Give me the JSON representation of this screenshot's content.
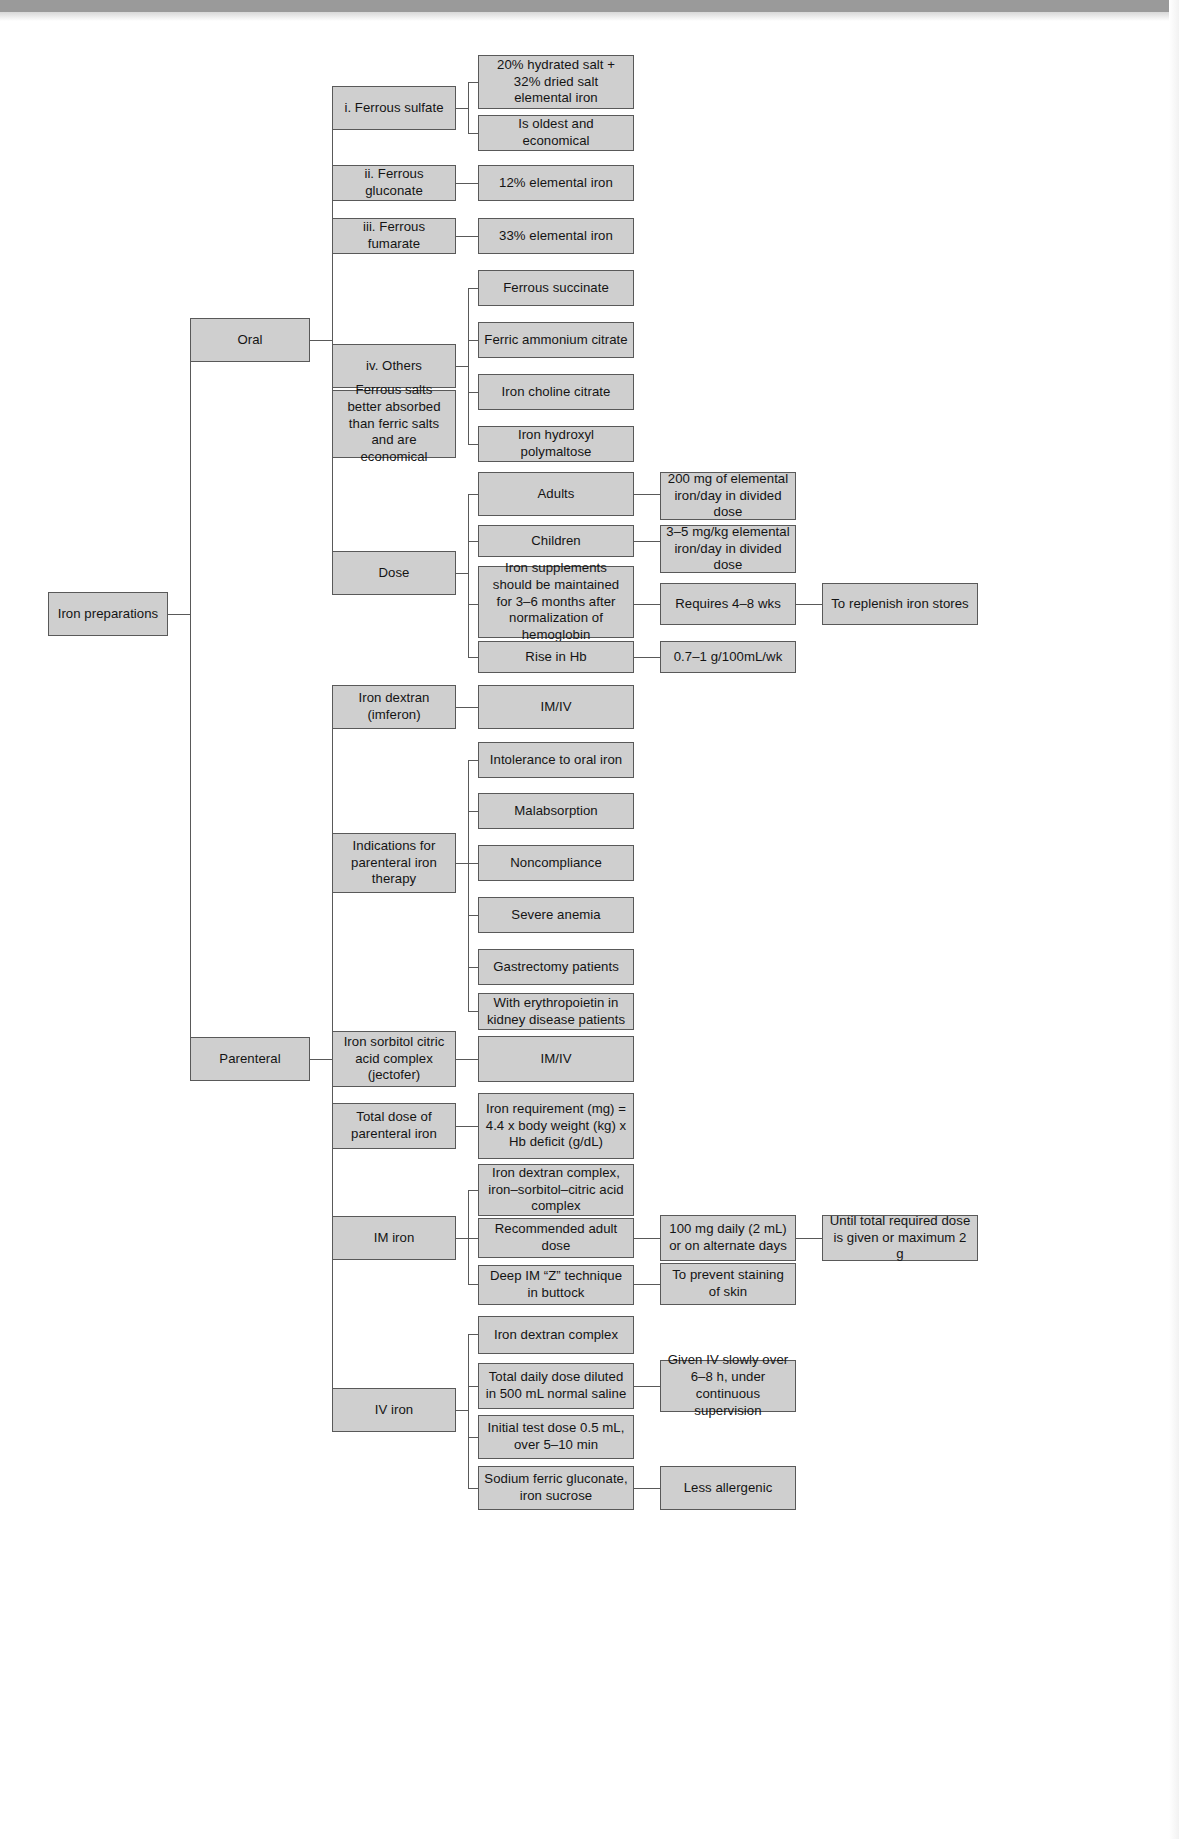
{
  "diagram": {
    "title": "Iron preparations",
    "root": {
      "label": "Iron preparations"
    },
    "branches": {
      "oral": {
        "label": "Oral"
      },
      "parenteral": {
        "label": "Parenteral"
      }
    },
    "oral_children": {
      "ferrous_sulfate": {
        "label": "i. Ferrous sulfate"
      },
      "ferrous_sulfate_d1": {
        "label": "20% hydrated salt + 32% dried salt elemental iron"
      },
      "ferrous_sulfate_d2": {
        "label": "Is oldest and economical"
      },
      "ferrous_gluconate": {
        "label": "ii. Ferrous gluconate"
      },
      "ferrous_gluconate_d1": {
        "label": "12% elemental iron"
      },
      "ferrous_fumarate": {
        "label": "iii. Ferrous fumarate"
      },
      "ferrous_fumarate_d1": {
        "label": "33% elemental iron"
      },
      "others": {
        "label": "iv. Others"
      },
      "others_d1": {
        "label": "Ferrous succinate"
      },
      "others_d2": {
        "label": "Ferric ammonium citrate"
      },
      "others_d3": {
        "label": "Iron choline citrate"
      },
      "others_d4": {
        "label": "Iron hydroxyl polymaltose"
      },
      "note": {
        "label": "Ferrous salts better absorbed than ferric salts and are economical"
      },
      "dose": {
        "label": "Dose"
      },
      "dose_adults": {
        "label": "Adults"
      },
      "dose_adults_d": {
        "label": "200 mg of elemental iron/day in divided dose"
      },
      "dose_children": {
        "label": "Children"
      },
      "dose_children_d": {
        "label": "3–5 mg/kg elemental iron/day in divided dose"
      },
      "dose_supplements": {
        "label": "Iron supplements should be maintained for 3–6 months after normalization of hemoglobin"
      },
      "dose_supplements_d": {
        "label": "Requires 4–8 wks"
      },
      "dose_supplements_d2": {
        "label": "To replenish iron stores"
      },
      "dose_rise_hb": {
        "label": "Rise in Hb"
      },
      "dose_rise_hb_d": {
        "label": "0.7–1 g/100mL/wk"
      }
    },
    "parenteral_children": {
      "iron_dextran": {
        "label": "Iron dextran (imferon)"
      },
      "iron_dextran_d": {
        "label": "IM/IV"
      },
      "indications": {
        "label": "Indications for parenteral iron therapy"
      },
      "ind_1": {
        "label": "Intolerance to oral iron"
      },
      "ind_2": {
        "label": "Malabsorption"
      },
      "ind_3": {
        "label": "Noncompliance"
      },
      "ind_4": {
        "label": "Severe anemia"
      },
      "ind_5": {
        "label": "Gastrectomy patients"
      },
      "ind_6": {
        "label": "With erythropoietin in kidney disease patients"
      },
      "iron_sorbitol": {
        "label": "Iron sorbitol citric acid complex (jectofer)"
      },
      "iron_sorbitol_d": {
        "label": "IM/IV"
      },
      "total_dose": {
        "label": "Total dose of parenteral  iron"
      },
      "total_dose_d": {
        "label": "Iron requirement (mg) = 4.4 x body weight (kg) x Hb deficit (g/dL)"
      },
      "im_iron": {
        "label": "IM iron"
      },
      "im_1": {
        "label": "Iron dextran complex, iron–sorbitol–citric acid complex"
      },
      "im_2": {
        "label": "Recommended adult dose"
      },
      "im_2_d": {
        "label": "100 mg daily (2 mL) or on  alternate days"
      },
      "im_2_d2": {
        "label": "Until total required dose is given or maximum 2 g"
      },
      "im_3": {
        "label": "Deep IM “Z” technique in buttock"
      },
      "im_3_d": {
        "label": "To prevent staining of skin"
      },
      "iv_iron": {
        "label": "IV iron"
      },
      "iv_1": {
        "label": "Iron dextran complex"
      },
      "iv_2": {
        "label": "Total daily dose diluted in 500 mL normal saline"
      },
      "iv_2_d": {
        "label": "Given IV slowly over 6–8 h, under continuous supervision"
      },
      "iv_3": {
        "label": "Initial test dose 0.5 mL, over 5–10 min"
      },
      "iv_4": {
        "label": "Sodium ferric gluconate, iron sucrose"
      },
      "iv_4_d": {
        "label": "Less allergenic"
      }
    },
    "colors": {
      "node_fill": "#cfcfcf",
      "node_border": "#595959",
      "connector": "#595959",
      "top_band": "#9a9a9a",
      "page_background": "#ffffff",
      "text": "#141414"
    }
  }
}
